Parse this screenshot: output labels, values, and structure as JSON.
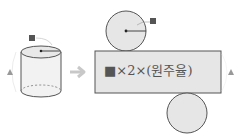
{
  "diagram": {
    "formula": "■×2×(원주율)",
    "markers": {
      "radius": "■",
      "height": "▲"
    },
    "colors": {
      "fill": "#e6e6e6",
      "stroke": "#555555",
      "marker": "#555555",
      "triangle": "#999999",
      "arrow": "#c8c8c8"
    }
  }
}
